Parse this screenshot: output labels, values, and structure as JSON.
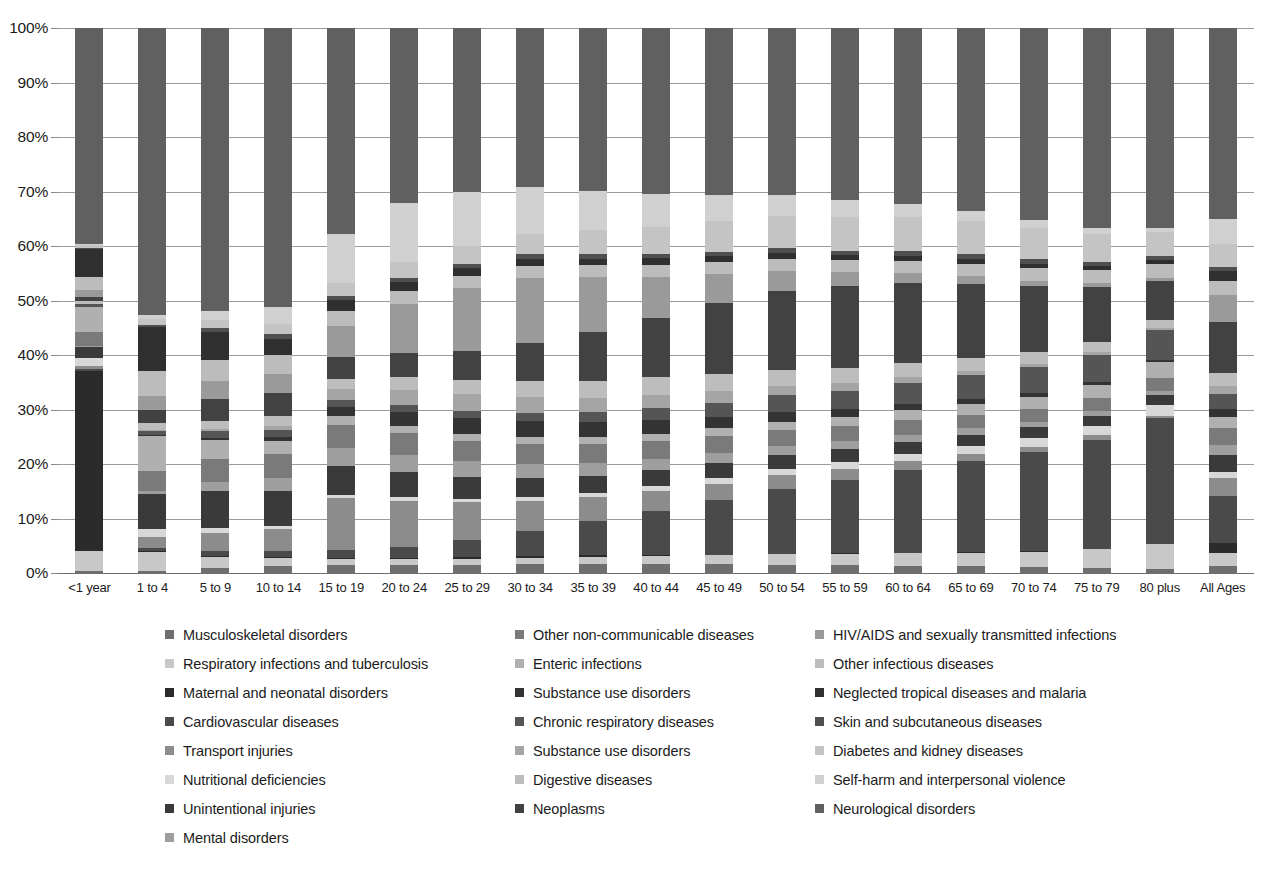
{
  "chart_data": {
    "type": "bar",
    "subtype": "stacked-percentage-column",
    "title": "",
    "subtitle": "",
    "xlabel": "",
    "ylabel": "",
    "ylim": [
      0,
      100
    ],
    "y_tick_labels": [
      "0%",
      "10%",
      "20%",
      "30%",
      "40%",
      "50%",
      "60%",
      "70%",
      "80%",
      "90%",
      "100%"
    ],
    "y_tick_values": [
      0,
      10,
      20,
      30,
      40,
      50,
      60,
      70,
      80,
      90,
      100
    ],
    "grid": true,
    "legend_position": "bottom",
    "legend_columns": 3,
    "categories": [
      "<1 year",
      "1 to 4",
      "5 to 9",
      "10 to 14",
      "15 to 19",
      "20 to 24",
      "25 to 29",
      "30 to 34",
      "35 to 39",
      "40 to 44",
      "45 to 49",
      "50 to 54",
      "55 to 59",
      "60 to 64",
      "65 to 69",
      "70 to 74",
      "75 to 79",
      "80 plus",
      "All Ages"
    ],
    "series": [
      {
        "name": "Musculoskeletal disorders",
        "color": "#6e6e6e",
        "values": [
          0.3,
          0.4,
          1.0,
          1.2,
          1.4,
          1.4,
          1.5,
          1.6,
          1.7,
          1.7,
          1.6,
          1.5,
          1.4,
          1.3,
          1.2,
          1.1,
          1.0,
          0.8,
          1.3
        ]
      },
      {
        "name": "Respiratory infections and tuberculosis",
        "color": "#c8c8c8",
        "values": [
          3.8,
          3.4,
          2.0,
          1.6,
          1.2,
          1.1,
          1.1,
          1.2,
          1.3,
          1.5,
          1.7,
          1.9,
          2.1,
          2.3,
          2.5,
          2.8,
          3.4,
          4.4,
          2.3
        ]
      },
      {
        "name": "Maternal and neonatal disorders",
        "color": "#2b2b2b",
        "values": [
          33.0,
          0.3,
          0.1,
          0.1,
          0.2,
          0.3,
          0.4,
          0.4,
          0.3,
          0.2,
          0.1,
          0.1,
          0.1,
          0.1,
          0.1,
          0.1,
          0.1,
          0.1,
          2.0
        ]
      },
      {
        "name": "Cardiovascular diseases",
        "color": "#4a4a4a",
        "values": [
          0.4,
          0.5,
          0.9,
          1.1,
          1.4,
          2.0,
          3.0,
          4.6,
          6.2,
          8.0,
          10.0,
          12.0,
          13.5,
          15.0,
          16.5,
          18.0,
          20.0,
          22.5,
          8.5
        ]
      },
      {
        "name": "Transport injuries",
        "color": "#8c8c8c",
        "values": [
          0.4,
          2.0,
          3.4,
          4.0,
          9.5,
          8.5,
          7.0,
          5.5,
          4.4,
          3.6,
          3.0,
          2.5,
          2.0,
          1.6,
          1.3,
          1.0,
          0.8,
          0.5,
          3.3
        ]
      },
      {
        "name": "Nutritional deficiencies",
        "color": "#d8d8d8",
        "values": [
          1.6,
          1.4,
          0.9,
          0.7,
          0.6,
          0.6,
          0.6,
          0.7,
          0.8,
          0.9,
          1.0,
          1.1,
          1.2,
          1.3,
          1.4,
          1.5,
          1.7,
          2.0,
          1.1
        ]
      },
      {
        "name": "Unintentional injuries",
        "color": "#3a3a3a",
        "values": [
          1.9,
          6.5,
          6.8,
          6.4,
          5.3,
          4.6,
          4.0,
          3.5,
          3.2,
          3.0,
          2.8,
          2.6,
          2.4,
          2.2,
          2.1,
          2.0,
          1.9,
          1.8,
          3.2
        ]
      },
      {
        "name": "Mental disorders",
        "color": "#9e9e9e",
        "values": [
          0.2,
          0.6,
          1.6,
          2.4,
          3.4,
          3.2,
          2.9,
          2.6,
          2.3,
          2.1,
          1.9,
          1.7,
          1.5,
          1.3,
          1.2,
          1.0,
          0.9,
          0.7,
          1.8
        ]
      },
      {
        "name": "Other non-communicable diseases",
        "color": "#7a7a7a",
        "values": [
          2.6,
          3.6,
          4.2,
          4.4,
          4.2,
          4.0,
          3.8,
          3.6,
          3.4,
          3.2,
          3.0,
          2.8,
          2.7,
          2.6,
          2.5,
          2.4,
          2.3,
          2.2,
          3.1
        ]
      },
      {
        "name": "Enteric infections",
        "color": "#b0b0b0",
        "values": [
          4.6,
          6.4,
          3.6,
          2.4,
          1.6,
          1.3,
          1.2,
          1.2,
          1.3,
          1.4,
          1.5,
          1.6,
          1.8,
          1.9,
          2.0,
          2.2,
          2.5,
          3.0,
          2.1
        ]
      },
      {
        "name": "Substance use disorders",
        "color": "#333333",
        "values": [
          0.1,
          0.2,
          0.3,
          0.6,
          1.7,
          2.6,
          3.0,
          3.0,
          2.8,
          2.5,
          2.1,
          1.8,
          1.4,
          1.1,
          0.9,
          0.7,
          0.5,
          0.3,
          1.4
        ]
      },
      {
        "name": "Chronic respiratory diseases",
        "color": "#555555",
        "values": [
          0.4,
          0.8,
          1.2,
          1.3,
          1.2,
          1.2,
          1.3,
          1.5,
          1.8,
          2.2,
          2.6,
          3.0,
          3.4,
          3.8,
          4.2,
          4.6,
          5.0,
          5.4,
          2.8
        ]
      },
      {
        "name": "Substance use disorders",
        "color": "#a5a5a5",
        "values": [
          0.1,
          0.2,
          0.4,
          0.8,
          2.0,
          2.8,
          3.0,
          2.9,
          2.7,
          2.4,
          2.1,
          1.7,
          1.4,
          1.1,
          0.9,
          0.7,
          0.5,
          0.3,
          1.5
        ]
      },
      {
        "name": "Digestive diseases",
        "color": "#bdbdbd",
        "values": [
          0.6,
          1.2,
          1.6,
          1.8,
          2.0,
          2.3,
          2.6,
          2.9,
          3.1,
          3.2,
          3.1,
          2.9,
          2.7,
          2.5,
          2.3,
          2.1,
          1.9,
          1.6,
          2.4
        ]
      },
      {
        "name": "Neoplasms",
        "color": "#424242",
        "values": [
          0.6,
          2.4,
          4.0,
          4.2,
          4.0,
          4.4,
          5.4,
          7.0,
          9.0,
          11.0,
          13.0,
          14.5,
          15.0,
          14.5,
          13.5,
          12.0,
          10.0,
          7.0,
          9.2
        ]
      },
      {
        "name": "HIV/AIDS and sexually transmitted infections",
        "color": "#9a9a9a",
        "values": [
          1.4,
          2.6,
          3.2,
          3.6,
          5.6,
          9.0,
          11.5,
          12.0,
          10.0,
          7.5,
          5.4,
          3.8,
          2.6,
          1.8,
          1.3,
          0.9,
          0.7,
          0.4,
          5.0
        ]
      },
      {
        "name": "Other infectious diseases",
        "color": "#bcbcbc",
        "values": [
          2.4,
          4.6,
          4.0,
          3.4,
          2.8,
          2.5,
          2.3,
          2.2,
          2.2,
          2.2,
          2.2,
          2.2,
          2.2,
          2.2,
          2.3,
          2.3,
          2.4,
          2.6,
          2.6
        ]
      },
      {
        "name": "Neglected tropical diseases and malaria",
        "color": "#2f2f2f",
        "values": [
          5.0,
          8.0,
          5.0,
          3.0,
          2.0,
          1.6,
          1.4,
          1.3,
          1.2,
          1.2,
          1.1,
          1.1,
          1.0,
          1.0,
          0.9,
          0.9,
          0.8,
          0.7,
          1.8
        ]
      },
      {
        "name": "Skin and subcutaneous diseases",
        "color": "#4f4f4f",
        "values": [
          0.3,
          0.5,
          0.7,
          0.8,
          0.8,
          0.8,
          0.8,
          0.8,
          0.8,
          0.8,
          0.8,
          0.8,
          0.8,
          0.8,
          0.8,
          0.8,
          0.8,
          0.8,
          0.8
        ]
      },
      {
        "name": "Diabetes and kidney diseases",
        "color": "#c4c4c4",
        "values": [
          0.5,
          1.0,
          1.6,
          2.0,
          2.4,
          2.8,
          3.2,
          3.8,
          4.4,
          5.0,
          5.6,
          6.0,
          6.2,
          6.2,
          6.0,
          5.6,
          5.0,
          4.2,
          4.2
        ]
      },
      {
        "name": "Self-harm and interpersonal violence",
        "color": "#d0d0d0",
        "values": [
          0.2,
          0.8,
          1.6,
          3.0,
          9.0,
          11.0,
          10.0,
          8.6,
          7.2,
          6.0,
          4.8,
          3.8,
          3.0,
          2.4,
          1.9,
          1.5,
          1.2,
          0.8,
          4.6
        ]
      },
      {
        "name": "Neurological disorders",
        "color": "#606060",
        "values": [
          39.6,
          52.6,
          51.9,
          51.2,
          37.7,
          32.0,
          30.0,
          29.1,
          29.9,
          30.4,
          30.6,
          30.6,
          31.6,
          31.9,
          33.2,
          34.9,
          36.7,
          35.9,
          35.0
        ]
      }
    ]
  },
  "legend": {
    "items": [
      {
        "label": "Musculoskeletal disorders",
        "color": "#6e6e6e"
      },
      {
        "label": "Other non-communicable diseases",
        "color": "#7a7a7a"
      },
      {
        "label": "HIV/AIDS and sexually transmitted infections",
        "color": "#9a9a9a"
      },
      {
        "label": "Respiratory infections and tuberculosis",
        "color": "#c8c8c8"
      },
      {
        "label": "Enteric infections",
        "color": "#b0b0b0"
      },
      {
        "label": "Other infectious diseases",
        "color": "#bcbcbc"
      },
      {
        "label": "Maternal and neonatal disorders",
        "color": "#2b2b2b"
      },
      {
        "label": "Substance use disorders",
        "color": "#333333"
      },
      {
        "label": "Neglected tropical diseases and malaria",
        "color": "#2f2f2f"
      },
      {
        "label": "Cardiovascular diseases",
        "color": "#4a4a4a"
      },
      {
        "label": "Chronic respiratory diseases",
        "color": "#555555"
      },
      {
        "label": "Skin and subcutaneous diseases",
        "color": "#4f4f4f"
      },
      {
        "label": "Transport injuries",
        "color": "#8c8c8c"
      },
      {
        "label": "Substance use disorders",
        "color": "#a5a5a5"
      },
      {
        "label": "Diabetes and kidney diseases",
        "color": "#c4c4c4"
      },
      {
        "label": "Nutritional deficiencies",
        "color": "#d8d8d8"
      },
      {
        "label": "Digestive diseases",
        "color": "#bdbdbd"
      },
      {
        "label": "Self-harm and interpersonal violence",
        "color": "#d0d0d0"
      },
      {
        "label": "Unintentional injuries",
        "color": "#3a3a3a"
      },
      {
        "label": "Neoplasms",
        "color": "#424242"
      },
      {
        "label": "Neurological disorders",
        "color": "#606060"
      },
      {
        "label": "Mental disorders",
        "color": "#9e9e9e"
      }
    ]
  }
}
